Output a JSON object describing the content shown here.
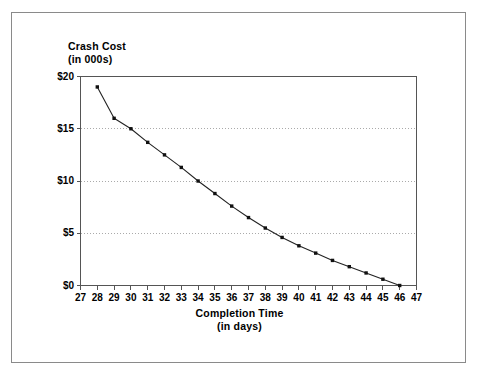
{
  "chart_data": {
    "type": "line",
    "title": "",
    "ylabel_line1": "Crash Cost",
    "ylabel_line2": "(in 000s)",
    "xlabel_line1": "Completion Time",
    "xlabel_line2": "(in days)",
    "xlim": [
      27,
      47
    ],
    "ylim": [
      0,
      20
    ],
    "xticks": [
      27,
      28,
      29,
      30,
      31,
      32,
      33,
      34,
      35,
      36,
      37,
      38,
      39,
      40,
      41,
      42,
      43,
      44,
      45,
      46,
      47
    ],
    "xtick_labels": [
      "27",
      "28",
      "29",
      "30",
      "31",
      "32",
      "33",
      "34",
      "35",
      "36",
      "37",
      "38",
      "39",
      "40",
      "41",
      "42",
      "43",
      "44",
      "45",
      "46",
      "47"
    ],
    "yticks": [
      0,
      5,
      10,
      15,
      20
    ],
    "ytick_labels": [
      "$0",
      "$5",
      "$10",
      "$15",
      "$20"
    ],
    "grid": "horizontal-dotted-at-5-10-15",
    "legend": "none",
    "marker": "square",
    "line_color": "#222222",
    "marker_color": "#111111",
    "grid_color": "#aaaaaa",
    "axis_color": "#555555",
    "x": [
      28,
      29,
      30,
      31,
      32,
      33,
      34,
      35,
      36,
      37,
      38,
      39,
      40,
      41,
      42,
      43,
      44,
      45,
      46
    ],
    "values": [
      19.0,
      16.0,
      15.0,
      13.7,
      12.5,
      11.3,
      10.0,
      8.8,
      7.6,
      6.5,
      5.5,
      4.6,
      3.8,
      3.1,
      2.4,
      1.8,
      1.2,
      0.6,
      0.0
    ],
    "series": [
      {
        "name": "Crash Cost",
        "values": [
          19.0,
          16.0,
          15.0,
          13.7,
          12.5,
          11.3,
          10.0,
          8.8,
          7.6,
          6.5,
          5.5,
          4.6,
          3.8,
          3.1,
          2.4,
          1.8,
          1.2,
          0.6,
          0.0
        ]
      }
    ]
  }
}
